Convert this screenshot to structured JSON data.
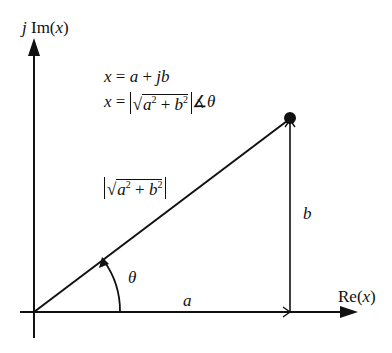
{
  "diagram": {
    "axes": {
      "y_label": {
        "prefix": "j",
        "text": "Im(",
        "var": "x",
        "close": ")"
      },
      "x_label": {
        "text": "Re(",
        "var": "x",
        "close": ")"
      }
    },
    "equations": {
      "rect": {
        "lhs": "x",
        "eq": " = ",
        "a": "a",
        "plus": " + ",
        "jb": "jb"
      },
      "polar": {
        "lhs": "x",
        "eq": " = ",
        "a": "a",
        "b": "b",
        "sq": "2",
        "plus": " + ",
        "angle": "∡",
        "theta": "θ"
      }
    },
    "magnitude_label": {
      "a": "a",
      "b": "b",
      "sq": "2",
      "plus": " + "
    },
    "labels": {
      "a": "a",
      "b": "b",
      "theta": "θ"
    },
    "colors": {
      "stroke": "#111111",
      "background": "#ffffff"
    }
  }
}
